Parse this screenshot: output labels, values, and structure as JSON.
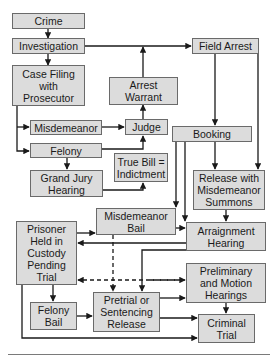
{
  "diagram": {
    "colors": {
      "box_fill": "#dcdcdc",
      "box_border": "#6a6a6a",
      "line": "#1a1a1a"
    },
    "nodes": {
      "crime": "Crime",
      "investigation": "Investigation",
      "case_filing": "Case Filing\nwith\nProsecutor",
      "arrest_warrant": "Arrest\nWarrant",
      "field_arrest": "Field Arrest",
      "misdemeanor": "Misdemeanor",
      "judge": "Judge",
      "felony": "Felony",
      "booking": "Booking",
      "true_bill": "True Bill =\nIndictment",
      "grand_jury": "Grand Jury\nHearing",
      "release_summons": "Release with\nMisdemeanor\nSummons",
      "misdemeanor_bail": "Misdemeanor\nBail",
      "prisoner_held": "Prisoner\nHeld in\nCustody\nPending\nTrial",
      "arraignment": "Arraignment\nHearing",
      "preliminary": "Preliminary\nand Motion\nHearings",
      "felony_bail": "Felony\nBail",
      "pretrial_release": "Pretrial or\nSentencing\nRelease",
      "criminal_trial": "Criminal\nTrial"
    },
    "edges": [
      {
        "from": "Crime",
        "to": "Investigation",
        "style": "solid"
      },
      {
        "from": "Investigation",
        "to": "Case Filing with Prosecutor",
        "style": "solid"
      },
      {
        "from": "Investigation",
        "to": "Field Arrest",
        "style": "solid"
      },
      {
        "from": "Arrest Warrant",
        "to": "Field Arrest",
        "style": "solid"
      },
      {
        "from": "Judge",
        "to": "Arrest Warrant",
        "style": "solid"
      },
      {
        "from": "Case Filing with Prosecutor",
        "to": "Misdemeanor",
        "style": "solid"
      },
      {
        "from": "Case Filing with Prosecutor",
        "to": "Felony",
        "style": "solid"
      },
      {
        "from": "Misdemeanor",
        "to": "Judge",
        "style": "solid"
      },
      {
        "from": "Felony",
        "to": "Judge",
        "style": "solid"
      },
      {
        "from": "Felony",
        "to": "Grand Jury Hearing",
        "style": "solid"
      },
      {
        "from": "Grand Jury Hearing",
        "to": "True Bill = Indictment",
        "style": "solid"
      },
      {
        "from": "Field Arrest",
        "to": "Booking",
        "style": "solid"
      },
      {
        "from": "Field Arrest",
        "to": "Release with Misdemeanor Summons",
        "style": "solid"
      },
      {
        "from": "Booking",
        "to": "Release with Misdemeanor Summons",
        "style": "solid"
      },
      {
        "from": "Booking",
        "to": "Misdemeanor Bail",
        "style": "solid"
      },
      {
        "from": "Booking",
        "to": "Arraignment Hearing",
        "style": "solid"
      },
      {
        "from": "Release with Misdemeanor Summons",
        "to": "Arraignment Hearing",
        "style": "solid"
      },
      {
        "from": "Misdemeanor Bail",
        "to": "Arraignment Hearing",
        "style": "solid"
      },
      {
        "from": "Prisoner Held in Custody Pending Trial",
        "to": "Misdemeanor Bail",
        "style": "solid"
      },
      {
        "from": "Arraignment Hearing",
        "to": "Prisoner Held in Custody Pending Trial",
        "style": "solid"
      },
      {
        "from": "Arraignment Hearing",
        "to": "Pretrial or Sentencing Release",
        "style": "solid"
      },
      {
        "from": "Misdemeanor Bail",
        "to": "Pretrial or Sentencing Release",
        "style": "dashed"
      },
      {
        "from": "Preliminary and Motion Hearings",
        "to": "Prisoner Held in Custody Pending Trial",
        "style": "dashed"
      },
      {
        "from": "Prisoner Held in Custody Pending Trial",
        "to": "Preliminary and Motion Hearings",
        "style": "dashed"
      },
      {
        "from": "Prisoner Held in Custody Pending Trial",
        "to": "Felony Bail",
        "style": "solid"
      },
      {
        "from": "Felony Bail",
        "to": "Pretrial or Sentencing Release",
        "style": "solid"
      },
      {
        "from": "Pretrial or Sentencing Release",
        "to": "Preliminary and Motion Hearings",
        "style": "solid"
      },
      {
        "from": "Pretrial or Sentencing Release",
        "to": "Criminal Trial",
        "style": "solid"
      },
      {
        "from": "Preliminary and Motion Hearings",
        "to": "Criminal Trial",
        "style": "solid"
      },
      {
        "from": "Prisoner Held in Custody Pending Trial",
        "to": "Criminal Trial",
        "style": "solid"
      }
    ]
  }
}
